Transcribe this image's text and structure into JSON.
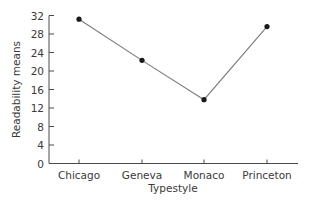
{
  "chart_data": {
    "type": "line",
    "title": "",
    "xlabel": "Typestyle",
    "ylabel": "Readability means",
    "categories": [
      "Chicago",
      "Geneva",
      "Monaco",
      "Princeton"
    ],
    "series": [
      {
        "name": "Readability means",
        "values": [
          31.2,
          22.3,
          13.8,
          29.6
        ]
      }
    ],
    "ylim": [
      0,
      32
    ],
    "yticks": [
      0,
      4,
      8,
      12,
      16,
      20,
      24,
      28,
      32
    ],
    "ytick_labels": [
      "0",
      "4",
      "8",
      "12",
      "16",
      "20",
      "24",
      "28",
      "32"
    ],
    "grid": false,
    "legend": "none",
    "colors": {
      "line": "#7a7a7a",
      "marker": "#1a1a1a",
      "axis": "#4a4a4a",
      "text": "#3a3a3a"
    }
  }
}
